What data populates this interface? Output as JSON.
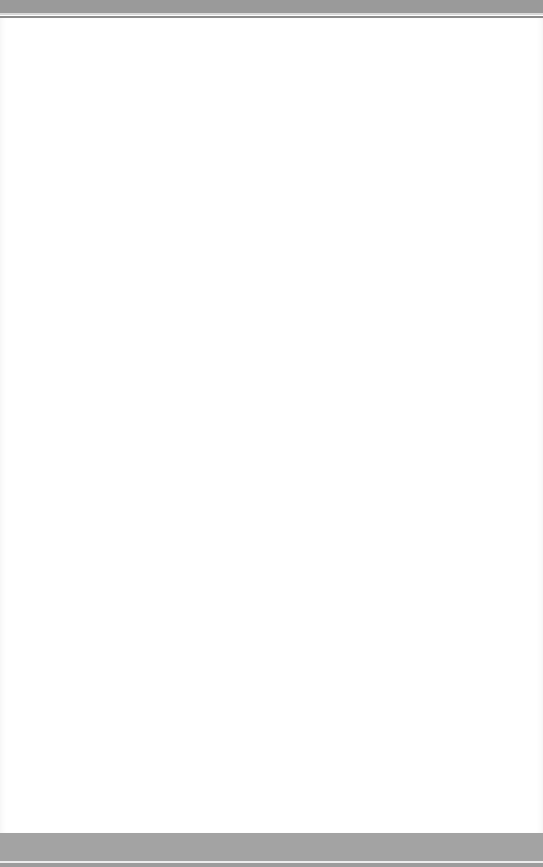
{
  "window": {
    "title": "",
    "state": "blank"
  },
  "header": {
    "text": ""
  },
  "main": {
    "content": ""
  },
  "footer": {
    "text": ""
  },
  "colors": {
    "top_bar": "#9a9a9a",
    "content_background": "#ffffff",
    "bottom_bar": "#a3a3a3"
  }
}
